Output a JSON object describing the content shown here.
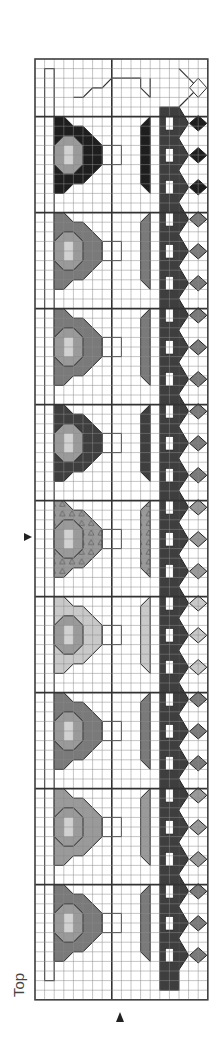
{
  "chart": {
    "orientation_label": "Top",
    "grid": {
      "left": 35,
      "top": 59,
      "cols": 18,
      "rows": 98,
      "cell_w": 9.6,
      "cell_h": 9.6,
      "thick_col_lines": [
        8
      ],
      "thick_row_lines": [
        6,
        16,
        26,
        36,
        46,
        56,
        66,
        76,
        86
      ]
    },
    "markers": [
      {
        "name": "row-marker-arrow",
        "direction": "right",
        "x": 30,
        "y": 537
      },
      {
        "name": "col-marker-arrow",
        "direction": "up",
        "x": 120,
        "y": 1015
      }
    ],
    "colors": {
      "black": "#1e1e1e",
      "dark": "#3e3e3e",
      "mid": "#7a7a7a",
      "medium_light": "#9a9a9a",
      "light": "#c9c9c9",
      "grid": "#8a8a8a",
      "thick": "#333333"
    },
    "motif_blocks": [
      {
        "index": 0,
        "color": "black",
        "row_start": 6
      },
      {
        "index": 1,
        "color": "mid",
        "row_start": 16
      },
      {
        "index": 2,
        "color": "mid",
        "row_start": 26
      },
      {
        "index": 3,
        "color": "dark",
        "row_start": 36
      },
      {
        "index": 4,
        "color": "medium_light",
        "row_start": 46,
        "pattern": "triangles"
      },
      {
        "index": 5,
        "color": "light",
        "row_start": 56
      },
      {
        "index": 6,
        "color": "mid",
        "row_start": 66
      },
      {
        "index": 7,
        "color": "medium_light",
        "row_start": 76
      },
      {
        "index": 8,
        "color": "mid",
        "row_start": 86
      }
    ]
  }
}
